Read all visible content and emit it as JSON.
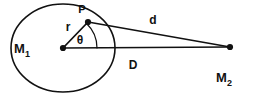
{
  "figure": {
    "colors": {
      "stroke": "#111111",
      "background": "#ffffff"
    },
    "bodies": [
      {
        "id": "primary",
        "label": "M",
        "subscript": "1",
        "shape": "ellipse",
        "center": {
          "x": 63,
          "y": 48
        },
        "radius_x": 53,
        "radius_y": 44,
        "label_pos": {
          "x": 22,
          "y": 53
        }
      },
      {
        "id": "secondary",
        "label": "M",
        "subscript": "2",
        "shape": "point",
        "center": {
          "x": 230,
          "y": 47
        },
        "label_pos": {
          "x": 221,
          "y": 82
        }
      }
    ],
    "points": [
      {
        "id": "surface-point",
        "label": "P",
        "position": {
          "x": 88,
          "y": 22
        },
        "label_pos": {
          "x": 82,
          "y": 12
        }
      },
      {
        "id": "center-point",
        "label": "",
        "position": {
          "x": 63,
          "y": 48
        },
        "label_pos": {
          "x": 63,
          "y": 48
        }
      }
    ],
    "segments": [
      {
        "id": "radius",
        "label": "r",
        "from": {
          "x": 63,
          "y": 48
        },
        "to": {
          "x": 88,
          "y": 22
        },
        "label_pos": {
          "x": 67,
          "y": 28
        }
      },
      {
        "id": "separation",
        "label": "D",
        "from": {
          "x": 63,
          "y": 48
        },
        "to": {
          "x": 230,
          "y": 47
        },
        "label_pos": {
          "x": 132,
          "y": 67
        }
      },
      {
        "id": "distance-to-point",
        "label": "d",
        "from": {
          "x": 88,
          "y": 22
        },
        "to": {
          "x": 230,
          "y": 47
        },
        "label_pos": {
          "x": 152,
          "y": 22
        }
      }
    ],
    "angles": [
      {
        "id": "polar-angle",
        "label": "θ",
        "vertex": {
          "x": 63,
          "y": 48
        },
        "between": [
          "separation",
          "radius"
        ],
        "arc_radius": 34,
        "label_pos": {
          "x": 79,
          "y": 42
        }
      }
    ]
  }
}
